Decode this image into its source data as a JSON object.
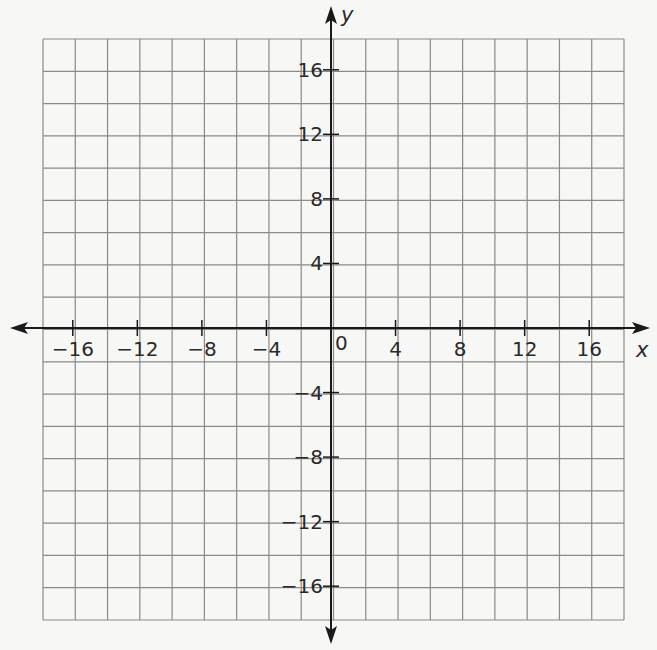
{
  "graph": {
    "x_axis_label": "x",
    "y_axis_label": "y",
    "origin_label": "0",
    "x_range": [
      -18,
      18
    ],
    "y_range": [
      -18,
      18
    ],
    "grid_step": 2,
    "x_tick_labels": [
      {
        "value": -16,
        "text": "−16"
      },
      {
        "value": -12,
        "text": "−12"
      },
      {
        "value": -8,
        "text": "−8"
      },
      {
        "value": -4,
        "text": "−4"
      },
      {
        "value": 4,
        "text": "4"
      },
      {
        "value": 8,
        "text": "8"
      },
      {
        "value": 12,
        "text": "12"
      },
      {
        "value": 16,
        "text": "16"
      }
    ],
    "y_tick_labels": [
      {
        "value": 16,
        "text": "16"
      },
      {
        "value": 12,
        "text": "12"
      },
      {
        "value": 8,
        "text": "8"
      },
      {
        "value": 4,
        "text": "4"
      },
      {
        "value": -4,
        "text": "−4"
      },
      {
        "value": -8,
        "text": "−8"
      },
      {
        "value": -12,
        "text": "−12"
      },
      {
        "value": -16,
        "text": "−16"
      }
    ],
    "colors": {
      "grid": "#8a8a8a",
      "axis": "#1a1a1a",
      "background": "#f7f7f6"
    }
  }
}
